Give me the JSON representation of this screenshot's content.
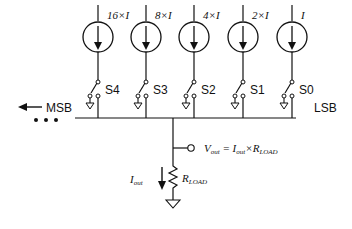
{
  "diagram": {
    "sources": [
      {
        "label": "16×I",
        "switch": "S4",
        "x": 98
      },
      {
        "label": "8×I",
        "switch": "S3",
        "x": 146
      },
      {
        "label": "4×I",
        "switch": "S2",
        "x": 194
      },
      {
        "label": "2×I",
        "switch": "S1",
        "x": 243
      },
      {
        "label": "I",
        "switch": "S0",
        "x": 292
      }
    ],
    "msb_label": "MSB",
    "lsb_label": "LSB",
    "ellipsis": "• • •",
    "output": {
      "vout_label": "V",
      "vout_sub": "out",
      "eq": " = I",
      "eq_sub1": "out",
      "times": "×R",
      "eq_sub2": "LOAD",
      "iout_label": "I",
      "iout_sub": "out",
      "rload_label": "R",
      "rload_sub": "LOAD"
    },
    "colors": {
      "line": "#111111",
      "background": "#ffffff"
    }
  }
}
